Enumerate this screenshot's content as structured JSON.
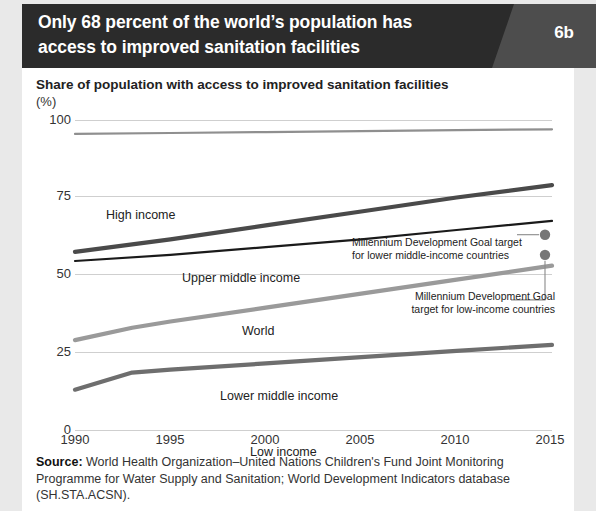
{
  "header": {
    "title": "Only 68 percent of the world’s population has access to improved sanitation facilities",
    "badge": "6b"
  },
  "subtitle": "Share of population with access to improved sanitation facilities",
  "axis_unit": "(%)",
  "source": {
    "label": "Source:",
    "text": " World Health Organization–United Nations Children's Fund Joint Monitoring Programme for Water Supply and Sanitation; World Development Indicators database (SH.STA.ACSN)."
  },
  "colors": {
    "header_bg": "#2b2b2b",
    "badge_panel": "#4d4d4d",
    "card_bg": "#ffffff",
    "page_bg": "#e9e9e9",
    "grid": "#cfcfcf",
    "high_income": "#8f8f8f",
    "upper_middle_income": "#4a4a4a",
    "world": "#1a1a1a",
    "lower_middle_income": "#9a9a9a",
    "low_income": "#6e6e6e",
    "marker": "#777777"
  },
  "chart_data": {
    "type": "line",
    "title": "Share of population with access to improved sanitation facilities (%)",
    "xlabel": "",
    "ylabel": "(%)",
    "xlim": [
      1990,
      2015
    ],
    "ylim": [
      0,
      100
    ],
    "yticks": [
      0,
      25,
      50,
      75,
      100
    ],
    "xticks": [
      1990,
      1995,
      2000,
      2005,
      2010,
      2015
    ],
    "grid": true,
    "legend": "inline-labels",
    "series": [
      {
        "name": "High income",
        "color": "#8f8f8f",
        "x": [
          1990,
          1995,
          2000,
          2005,
          2010,
          2015
        ],
        "values": [
          95.5,
          95.8,
          96.1,
          96.4,
          96.7,
          97.0
        ]
      },
      {
        "name": "Upper middle income",
        "color": "#4a4a4a",
        "x": [
          1990,
          1995,
          2000,
          2005,
          2010,
          2015
        ],
        "values": [
          57.5,
          61.5,
          66.0,
          70.5,
          75.0,
          79.0
        ]
      },
      {
        "name": "World",
        "color": "#1a1a1a",
        "x": [
          1990,
          1995,
          2000,
          2005,
          2010,
          2015
        ],
        "values": [
          54.5,
          56.5,
          59.0,
          61.5,
          64.5,
          67.5
        ]
      },
      {
        "name": "Lower middle income",
        "color": "#9a9a9a",
        "x": [
          1990,
          1993,
          1995,
          2000,
          2005,
          2010,
          2015
        ],
        "values": [
          29.0,
          33.0,
          35.0,
          39.5,
          44.0,
          48.5,
          53.0
        ]
      },
      {
        "name": "Low income",
        "color": "#6e6e6e",
        "x": [
          1990,
          1993,
          1995,
          2000,
          2005,
          2010,
          2015
        ],
        "values": [
          13.0,
          18.5,
          19.5,
          21.5,
          23.5,
          25.5,
          27.5
        ]
      }
    ],
    "markers": [
      {
        "name": "Millennium Development Goal target for lower middle-income countries",
        "x": 2015,
        "value": 63.0
      },
      {
        "name": "Millennium Development Goal target for low-income countries",
        "x": 2015,
        "value": 56.5
      }
    ],
    "annotations": [
      {
        "text_line1": "Millennium Development Goal target",
        "text_line2": "for lower middle-income countries"
      },
      {
        "text_line1": "Millennium Development Goal",
        "text_line2": "target for low-income countries"
      }
    ]
  }
}
